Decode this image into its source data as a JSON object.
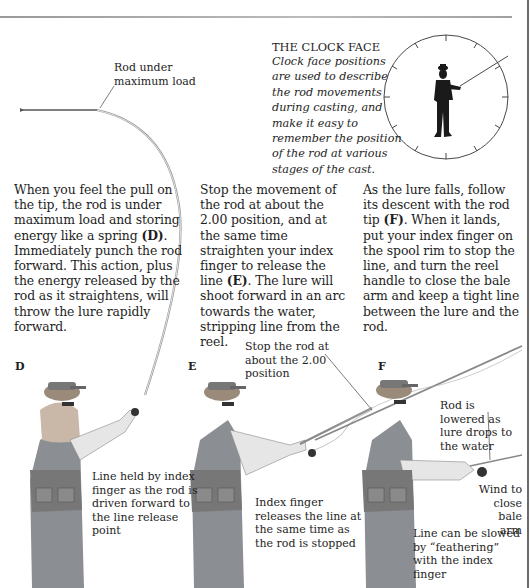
{
  "clock_face": {
    "title": "THE CLOCK FACE",
    "description": "Clock face positions are used to describe the rod movements during casting, and make it easy to remember the position of the rod at various stages of the cast."
  },
  "labels": {
    "rod_max_load": "Rod under maximum load"
  },
  "columns": [
    {
      "id": "D",
      "pre": "When you feel the pull on the tip, the rod is under maximum load and storing energy like a spring ",
      "ref": "(D)",
      "post": ". Immediately punch the rod forward. This action, plus the energy released by the rod as it straightens, will throw the lure rapidly forward."
    },
    {
      "id": "E",
      "pre": "Stop the movement of the rod at about the 2.00 position, and at the same time straighten your index finger to release the line ",
      "ref": "(E)",
      "post": ". The lure will shoot forward in an arc towards the water, stripping line from the reel."
    },
    {
      "id": "F",
      "pre": "As the lure falls, follow its descent with the rod tip ",
      "ref": "(F)",
      "post": ". When it lands, put your index finger on the spool rim to stop the line, and turn the reel handle to close the bale arm and keep a tight line between the lure and the rod."
    }
  ],
  "figures": {
    "D": {
      "letter": "D",
      "caption": "Line held by index finger as the rod is driven forward to the line release point"
    },
    "E": {
      "letter": "E",
      "caption_top": "Stop the rod at about the 2.00 position",
      "caption": "Index finger releases the line at the same time as the rod is stopped"
    },
    "F": {
      "letter": "F",
      "caption_rod": "Rod is lowered as lure drops to the water",
      "caption_wind": "Wind to close bale arm",
      "caption_feather": "Line can be slowed by “feathering” with the index finger"
    }
  },
  "colors": {
    "text": "#1e1e1e",
    "rule": "#a0a0a0",
    "silhouette": "#1a1a1a"
  }
}
